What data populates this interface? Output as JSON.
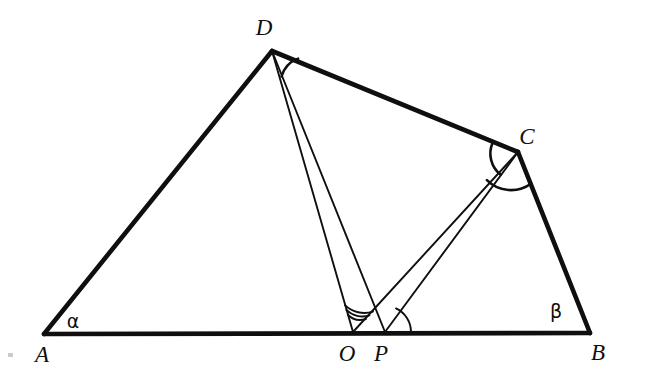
{
  "figure": {
    "kind": "geometry-diagram",
    "background_color": "#ffffff",
    "ink_color": "#100f0d",
    "canvas": {
      "width": 645,
      "height": 385
    },
    "vertices": [
      {
        "id": "A",
        "label": "A",
        "x": 44,
        "y": 334,
        "label_x": 42,
        "label_y": 362
      },
      {
        "id": "B",
        "label": "B",
        "x": 590,
        "y": 333,
        "label_x": 598,
        "label_y": 360
      },
      {
        "id": "C",
        "label": "C",
        "x": 518,
        "y": 152,
        "label_x": 527,
        "label_y": 144
      },
      {
        "id": "D",
        "label": "D",
        "x": 272,
        "y": 51,
        "label_x": 264,
        "label_y": 35
      },
      {
        "id": "O",
        "label": "O",
        "x": 353,
        "y": 332,
        "label_x": 347,
        "label_y": 361
      },
      {
        "id": "P",
        "label": "P",
        "x": 385,
        "y": 332,
        "label_x": 381,
        "label_y": 361
      }
    ],
    "angle_labels": [
      {
        "id": "alpha",
        "label": "α",
        "x": 73,
        "y": 328,
        "at_vertex": "A"
      },
      {
        "id": "beta",
        "label": "β",
        "x": 556,
        "y": 318,
        "at_vertex": "B"
      }
    ],
    "thick_edges": [
      {
        "id": "AB",
        "from": "A",
        "to": "B"
      },
      {
        "id": "AD",
        "from": "A",
        "to": "D"
      },
      {
        "id": "DC",
        "from": "D",
        "to": "C"
      },
      {
        "id": "CB",
        "from": "C",
        "to": "B"
      }
    ],
    "thin_edges": [
      {
        "id": "DO",
        "from": "D",
        "to": "O"
      },
      {
        "id": "DP",
        "from": "D",
        "to": "P"
      },
      {
        "id": "CO",
        "from": "C",
        "to": "O"
      },
      {
        "id": "CP",
        "from": "C",
        "to": "P"
      }
    ],
    "angle_arcs": [
      {
        "id": "arc-D-PDC",
        "at_vertex": "D",
        "radius": 27,
        "between": [
          "DP",
          "DC"
        ]
      },
      {
        "id": "arc-C-DCO",
        "at_vertex": "C",
        "radius": 27,
        "between": [
          "CD",
          "CO"
        ]
      },
      {
        "id": "arc-C-OCB",
        "at_vertex": "C",
        "radius": 34,
        "between": [
          "CO",
          "CB"
        ]
      },
      {
        "id": "arc-O-1",
        "at_vertex": "O",
        "radius": 18,
        "between": [
          "OD",
          "OC"
        ]
      },
      {
        "id": "arc-O-2",
        "at_vertex": "O",
        "radius": 23,
        "between": [
          "OD",
          "OC"
        ]
      },
      {
        "id": "arc-O-3",
        "at_vertex": "O",
        "radius": 28,
        "between": [
          "OD",
          "OC"
        ]
      },
      {
        "id": "arc-P-1",
        "at_vertex": "P",
        "radius": 26,
        "between": [
          "PB",
          "PC"
        ]
      }
    ]
  }
}
